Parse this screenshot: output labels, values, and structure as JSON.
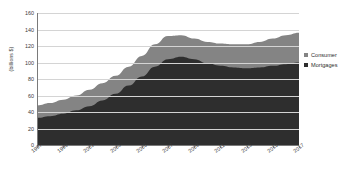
{
  "chart_data": {
    "type": "area",
    "stacked": true,
    "title": "",
    "xlabel": "",
    "ylabel": "(billions $)",
    "ylim": [
      0,
      160
    ],
    "ytick_step": 20,
    "yticks": [
      0,
      20,
      40,
      60,
      80,
      100,
      120,
      140,
      160
    ],
    "grid": true,
    "legend_position": "right",
    "x": [
      1997,
      1998,
      1999,
      2000,
      2001,
      2002,
      2003,
      2004,
      2005,
      2006,
      2007,
      2008,
      2009,
      2010,
      2011,
      2012,
      2013,
      2014,
      2015,
      2016,
      2017
    ],
    "xtick_labels": [
      "1997",
      "1999",
      "2001",
      "2003",
      "2005",
      "2007",
      "2009",
      "2011",
      "2013",
      "2015",
      "2017"
    ],
    "xticks": [
      1997,
      1999,
      2001,
      2003,
      2005,
      2007,
      2009,
      2011,
      2013,
      2015,
      2017
    ],
    "series": [
      {
        "name": "Mortgages",
        "color": "#2e2e2e",
        "values": [
          33,
          35,
          38,
          42,
          47,
          54,
          62,
          72,
          83,
          95,
          104,
          107,
          104,
          99,
          96,
          94,
          93,
          94,
          96,
          98,
          100
        ]
      },
      {
        "name": "Consumer",
        "color": "#848484",
        "values": [
          15,
          16,
          17,
          18,
          20,
          21,
          22,
          23,
          25,
          27,
          28,
          26,
          25,
          26,
          27,
          28,
          29,
          31,
          33,
          35,
          36
        ]
      }
    ],
    "totals": [
      48,
      51,
      55,
      60,
      67,
      75,
      84,
      95,
      108,
      122,
      132,
      133,
      129,
      125,
      123,
      122,
      122,
      125,
      129,
      133,
      136
    ]
  },
  "legend": {
    "items": [
      {
        "label": "Consumer",
        "color": "#848484"
      },
      {
        "label": "Mortgages",
        "color": "#2e2e2e"
      }
    ]
  }
}
